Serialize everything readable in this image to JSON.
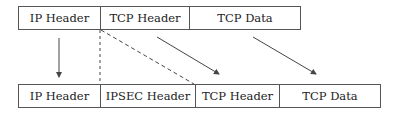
{
  "diagram": {
    "original_packet": {
      "fields": [
        {
          "label": "IP Header",
          "width": 82
        },
        {
          "label": "TCP Header",
          "width": 89
        },
        {
          "label": "TCP Data",
          "width": 112
        }
      ]
    },
    "ipsec_packet": {
      "fields": [
        {
          "label": "IP Header",
          "width": 82
        },
        {
          "label": "IPSEC Header",
          "width": 95
        },
        {
          "label": "TCP Header",
          "width": 84
        },
        {
          "label": "TCP Data",
          "width": 102
        }
      ]
    },
    "connectors": [
      {
        "type": "solid-arrow",
        "from": "IP Header",
        "to": "IP Header"
      },
      {
        "type": "dashed-line",
        "description": "insertion point of IPSEC Header"
      },
      {
        "type": "solid-arrow",
        "from": "TCP Header",
        "to": "TCP Header"
      },
      {
        "type": "solid-arrow",
        "from": "TCP Data",
        "to": "TCP Data"
      }
    ],
    "colors": {
      "line": "#444444",
      "text": "#222222",
      "background": "#ffffff"
    }
  }
}
